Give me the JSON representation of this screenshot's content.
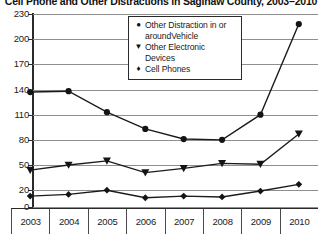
{
  "chart_data": {
    "type": "line",
    "title": "Cell Phone and Other Distractions in Saginaw County, 2003–2010",
    "xlabel": "",
    "ylabel": "",
    "categories": [
      "2003",
      "2004",
      "2005",
      "2006",
      "2007",
      "2008",
      "2009",
      "2010"
    ],
    "ylim": [
      0,
      230
    ],
    "yticks": [
      0,
      20,
      50,
      80,
      110,
      140,
      170,
      200,
      230
    ],
    "grid": true,
    "legend_position": "top-center",
    "series": [
      {
        "name": "Other Distraction in or around Vehicle",
        "marker": "circle",
        "values": [
          137,
          138,
          113,
          93,
          81,
          80,
          110,
          218
        ]
      },
      {
        "name": "Other Electronic Devices",
        "marker": "triangle-down",
        "values": [
          44,
          50,
          55,
          41,
          46,
          52,
          51,
          87
        ]
      },
      {
        "name": "Cell Phones",
        "marker": "diamond",
        "values": [
          13,
          15,
          20,
          11,
          13,
          12,
          19,
          27
        ]
      }
    ]
  },
  "legend": {
    "items": [
      {
        "marker_glyph": "●",
        "label": "Other Distraction in or aroundVehicle"
      },
      {
        "marker_glyph": "▼",
        "label": "Other Electronic Devices"
      },
      {
        "marker_glyph": "♦",
        "label": "Cell Phones"
      }
    ]
  }
}
